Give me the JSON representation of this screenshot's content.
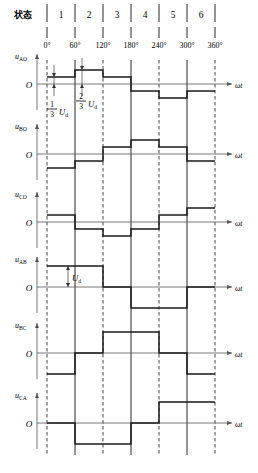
{
  "figure": {
    "state_row_label": "状态",
    "state_numbers": [
      "1",
      "2",
      "3",
      "4",
      "5",
      "6"
    ],
    "angle_ticks": [
      "0°",
      "60°",
      "120°",
      "180°",
      "240°",
      "300°",
      "360°"
    ],
    "zero_label": "O",
    "time_axis_label": "ωt",
    "annotations": {
      "one_third_num": "1",
      "one_third_den": "3",
      "one_third_unit": "U",
      "one_third_unit_sub": "d",
      "two_thirds_num": "2",
      "two_thirds_den": "3",
      "two_thirds_unit": "U",
      "two_thirds_unit_sub": "d",
      "ud_label": "U",
      "ud_label_sub": "d"
    },
    "colors": {
      "waveform": "#1a1a1a",
      "axis": "#555555",
      "gridline_solid": "#111111",
      "gridline_dashed": "#333333",
      "background": "#ffffff"
    }
  },
  "chart_data": {
    "type": "line",
    "xlabel": "ωt",
    "ylabel": "",
    "x": [
      0,
      60,
      120,
      180,
      240,
      300,
      360
    ],
    "xlim": [
      0,
      360
    ],
    "x_tick_labels": [
      "0°",
      "60°",
      "120°",
      "180°",
      "240°",
      "300°",
      "360°"
    ],
    "grid": true,
    "legend": "none",
    "unit": "U_d",
    "states": [
      "1",
      "2",
      "3",
      "4",
      "5",
      "6"
    ],
    "series": [
      {
        "name": "u_AO",
        "label": "u",
        "label_sub": "AO",
        "ylim": [
          -1,
          1
        ],
        "step_values": [
          0.3333,
          0.6667,
          0.3333,
          -0.3333,
          -0.6667,
          -0.3333
        ]
      },
      {
        "name": "u_BO",
        "label": "u",
        "label_sub": "BO",
        "ylim": [
          -1,
          1
        ],
        "step_values": [
          -0.6667,
          -0.3333,
          0.3333,
          0.6667,
          0.3333,
          -0.3333
        ]
      },
      {
        "name": "u_CO",
        "label": "u",
        "label_sub": "CO",
        "ylim": [
          -1,
          1
        ],
        "step_values": [
          0.3333,
          -0.3333,
          -0.6667,
          -0.3333,
          0.3333,
          0.6667
        ]
      },
      {
        "name": "u_AB",
        "label": "u",
        "label_sub": "AB",
        "ylim": [
          -1,
          1
        ],
        "step_values": [
          1,
          1,
          0,
          -1,
          -1,
          0
        ]
      },
      {
        "name": "u_BC",
        "label": "u",
        "label_sub": "BC",
        "ylim": [
          -1,
          1
        ],
        "step_values": [
          -1,
          0,
          1,
          1,
          0,
          -1
        ]
      },
      {
        "name": "u_CA",
        "label": "u",
        "label_sub": "CA",
        "ylim": [
          -1,
          1
        ],
        "step_values": [
          0,
          -1,
          -1,
          0,
          1,
          1
        ]
      }
    ]
  }
}
